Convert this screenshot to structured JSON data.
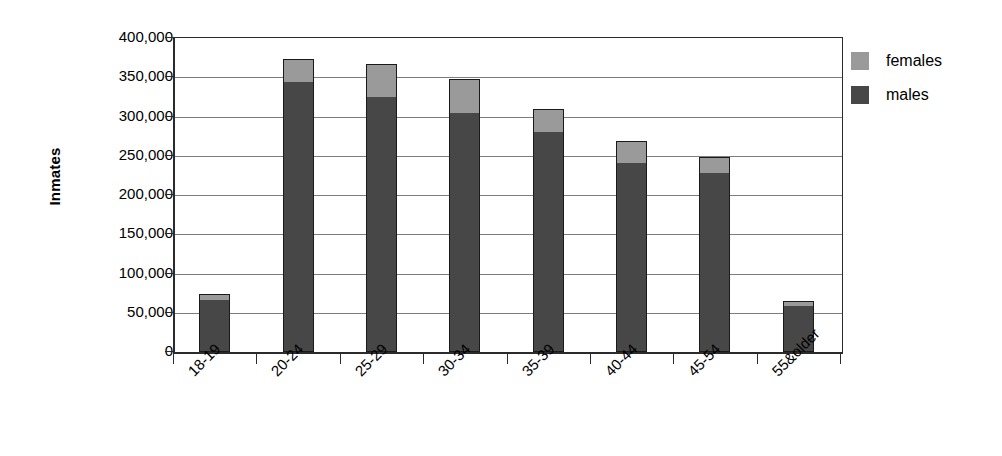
{
  "chart_data": {
    "type": "bar",
    "barmode": "stacked",
    "title": "",
    "xlabel": "",
    "ylabel": "Inmates",
    "ylim": [
      0,
      400000
    ],
    "yticks": [
      0,
      50000,
      100000,
      150000,
      200000,
      250000,
      300000,
      350000,
      400000
    ],
    "ytick_labels": [
      "0",
      "50,000",
      "100,000",
      "150,000",
      "200,000",
      "250,000",
      "300,000",
      "350,000",
      "400,000"
    ],
    "grid": true,
    "legend_position": "right",
    "categories": [
      "18-19",
      "20-24",
      "25-29",
      "30-34",
      "35-39",
      "40-44",
      "45-54",
      "55&older"
    ],
    "series": [
      {
        "name": "males",
        "color": "#474747",
        "values": [
          66000,
          344000,
          325000,
          305000,
          280000,
          241000,
          228000,
          58000
        ]
      },
      {
        "name": "females",
        "color": "#9a9a9a",
        "values": [
          8000,
          29000,
          42000,
          43000,
          30000,
          28000,
          20000,
          7000
        ]
      }
    ],
    "totals": [
      74000,
      373000,
      367000,
      348000,
      310000,
      269000,
      248000,
      65000
    ]
  },
  "legend": {
    "items": [
      {
        "label": "females",
        "color": "#9a9a9a"
      },
      {
        "label": "males",
        "color": "#474747"
      }
    ]
  },
  "axis": {
    "y_title": "Inmates"
  },
  "colors": {
    "axis_line": "#2b2b2b",
    "gridline": "#7d7d7d",
    "bar_outline": "#1a1a1a",
    "background": "#ffffff"
  }
}
